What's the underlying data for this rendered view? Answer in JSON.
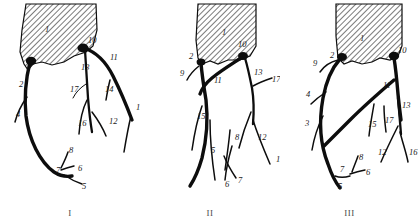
{
  "figure": {
    "panel_count": 3,
    "background_color": "#ffffff",
    "ink_color": "#0d0d0d"
  },
  "panels": [
    {
      "id": "panel-1",
      "caption": "I",
      "aorta_label": "1",
      "labels": [
        {
          "text": "1",
          "x": 45,
          "y": 32
        },
        {
          "text": "10",
          "x": 88,
          "y": 43
        },
        {
          "text": "11",
          "x": 110,
          "y": 60
        },
        {
          "text": "13",
          "x": 81,
          "y": 70
        },
        {
          "text": "2",
          "x": 19,
          "y": 87
        },
        {
          "text": "17",
          "x": 70,
          "y": 92
        },
        {
          "text": "14",
          "x": 105,
          "y": 92
        },
        {
          "text": "4",
          "x": 16,
          "y": 117
        },
        {
          "text": "15",
          "x": 136,
          "y": 110
        },
        {
          "text": "16",
          "x": 78,
          "y": 126
        },
        {
          "text": "12",
          "x": 109,
          "y": 124
        },
        {
          "text": "8",
          "x": 69,
          "y": 153
        },
        {
          "text": "7",
          "x": 56,
          "y": 173
        },
        {
          "text": "6",
          "x": 78,
          "y": 171
        },
        {
          "text": "5",
          "x": 82,
          "y": 189
        }
      ]
    },
    {
      "id": "panel-2",
      "caption": "II",
      "aorta_label": "1",
      "labels": [
        {
          "text": "1",
          "x": 82,
          "y": 35
        },
        {
          "text": "10",
          "x": 98,
          "y": 47
        },
        {
          "text": "2",
          "x": 49,
          "y": 59
        },
        {
          "text": "9",
          "x": 40,
          "y": 76
        },
        {
          "text": "11",
          "x": 74,
          "y": 83
        },
        {
          "text": "13",
          "x": 114,
          "y": 75
        },
        {
          "text": "17",
          "x": 132,
          "y": 82
        },
        {
          "text": "15",
          "x": 57,
          "y": 119
        },
        {
          "text": "8",
          "x": 95,
          "y": 140
        },
        {
          "text": "5",
          "x": 71,
          "y": 153
        },
        {
          "text": "12",
          "x": 118,
          "y": 140
        },
        {
          "text": "15",
          "x": 136,
          "y": 162
        },
        {
          "text": "6",
          "x": 85,
          "y": 187
        },
        {
          "text": "7",
          "x": 98,
          "y": 183
        }
      ]
    },
    {
      "id": "panel-3",
      "caption": "III",
      "aorta_label": "1",
      "labels": [
        {
          "text": "1",
          "x": 80,
          "y": 41
        },
        {
          "text": "10",
          "x": 118,
          "y": 53
        },
        {
          "text": "2",
          "x": 50,
          "y": 58
        },
        {
          "text": "9",
          "x": 33,
          "y": 66
        },
        {
          "text": "11",
          "x": 103,
          "y": 88
        },
        {
          "text": "4",
          "x": 26,
          "y": 97
        },
        {
          "text": "13",
          "x": 122,
          "y": 108
        },
        {
          "text": "3",
          "x": 25,
          "y": 126
        },
        {
          "text": "15",
          "x": 88,
          "y": 127
        },
        {
          "text": "17",
          "x": 105,
          "y": 123
        },
        {
          "text": "12",
          "x": 98,
          "y": 155
        },
        {
          "text": "16",
          "x": 129,
          "y": 155
        },
        {
          "text": "8",
          "x": 79,
          "y": 160
        },
        {
          "text": "7",
          "x": 60,
          "y": 172
        },
        {
          "text": "6",
          "x": 86,
          "y": 175
        },
        {
          "text": "5",
          "x": 58,
          "y": 189
        }
      ]
    }
  ]
}
